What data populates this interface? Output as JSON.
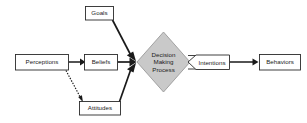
{
  "diagram": {
    "background_color": "#ffffff",
    "shape_fill": "#ffffff",
    "shape_stroke": "#2b2b2b",
    "diamond_fill": "#c9c9c9",
    "connector_color": "#1a1a1a",
    "nodes": [
      {
        "id": "perceptions",
        "label": "Perceptions",
        "shape": "rectangle"
      },
      {
        "id": "goals",
        "label": "Goals",
        "shape": "rectangle"
      },
      {
        "id": "beliefs",
        "label": "Beliefs",
        "shape": "rectangle"
      },
      {
        "id": "attitudes",
        "label": "Attitudes",
        "shape": "rectangle"
      },
      {
        "id": "decision-making-process",
        "label": "Decision Making Process",
        "shape": "diamond",
        "line1": "Decision",
        "line2": "Making",
        "line3": "Process"
      },
      {
        "id": "intentions",
        "label": "Intentions",
        "shape": "pentagon-arrow"
      },
      {
        "id": "behaviors",
        "label": "Behaviors",
        "shape": "rectangle"
      }
    ],
    "connectors": [
      {
        "id": "perceptions-to-beliefs",
        "from": "perceptions",
        "to": "beliefs",
        "style": "solid",
        "arrow": true
      },
      {
        "id": "perceptions-to-attitudes",
        "from": "perceptions",
        "to": "attitudes",
        "style": "dotted",
        "arrow": true
      },
      {
        "id": "goals-to-decision",
        "from": "goals",
        "to": "decision-making-process",
        "style": "solid",
        "arrow": true
      },
      {
        "id": "beliefs-to-decision",
        "from": "beliefs",
        "to": "decision-making-process",
        "style": "solid",
        "arrow": true
      },
      {
        "id": "attitudes-to-decision",
        "from": "attitudes",
        "to": "decision-making-process",
        "style": "solid",
        "arrow": true
      },
      {
        "id": "decision-to-intentions",
        "from": "decision-making-process",
        "to": "intentions",
        "style": "solid",
        "arrow": false
      },
      {
        "id": "intentions-to-behaviors",
        "from": "intentions",
        "to": "behaviors",
        "style": "solid",
        "arrow": true
      }
    ]
  }
}
